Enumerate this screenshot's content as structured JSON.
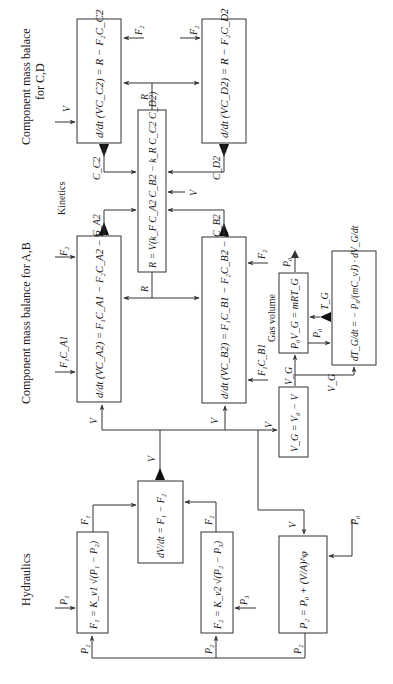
{
  "diagram": {
    "orientation": "rotated-90-ccw",
    "sections": {
      "cd_title_line1": "Component mass balace",
      "cd_title_line2": "for C,D",
      "kinetics": "Kinetics",
      "ab_title": "Component mass balance for A,B",
      "gas_volume": "Gas volume",
      "hydraulics": "Hydraulics"
    },
    "blocks": {
      "c2": "d/dt (VC_C2) = R − F₂C_C2",
      "d2": "d/dt (VC_D2) = R − F₂C_D2",
      "kinetics": "R = V(k_F C_A2 C_B2 − k_R C_C2 C_D2)",
      "a2": "d/dt (VC_A2) = F₁C_A1 − F₂C_A2 − R",
      "b2": "d/dt (VC_B2) = F₁C_B1 − F₂C_B2 − R",
      "gas": "P₀V_G = mRT_G",
      "temp": "dT_G/dt = − P₀/(mC_vJ) · dV_G/dt",
      "vg": "V_G = V₀ − V",
      "dvdt": "dV/dt = F₁ − F₂",
      "f1": "F₁ = K_v1 √(P₁ − P₂)",
      "f2": "F₂ = K_v2 √(P₂ − P₃)",
      "p2": "P₂ = P₀ + (V/A)^φ"
    },
    "signals": {
      "V": "V",
      "F2": "F₂",
      "F1": "F₁",
      "R": "R",
      "C_C2": "C_C2",
      "C_D2": "C_D2",
      "C_A2": "C_A2",
      "C_B2": "C_B2",
      "F1C_A1": "F₁C_A1",
      "F1C_B1": "F₁C_B1",
      "P0": "P₀",
      "P1": "P₁",
      "P2": "P₂",
      "P3": "P₃",
      "T_G": "T_G",
      "V_G": "V_G"
    }
  }
}
